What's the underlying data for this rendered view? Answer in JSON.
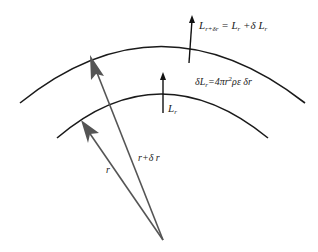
{
  "diagram": {
    "labels": {
      "top_luminosity": {
        "L": "L",
        "sub": "r+δr",
        "eq": " = L",
        "sub2": "r",
        "rest": " +δ L",
        "sub3": "r"
      },
      "shell_increment": {
        "pre": "δL",
        "sub": "r",
        "eq": "=4πr",
        "sup": "2",
        "rest": "ρε δr"
      },
      "inner_luminosity": {
        "L": "L",
        "sub": "r"
      },
      "radius_inner": "r",
      "radius_outer": "r+δ r"
    },
    "colors": {
      "arc": "#1a1a1a",
      "radius_arrow": "#555555",
      "luminosity_arrow": "#111111",
      "text": "#222222"
    }
  }
}
